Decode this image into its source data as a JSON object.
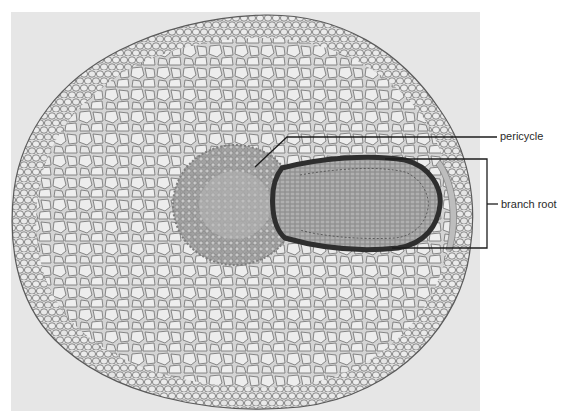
{
  "figure": {
    "labels": [
      {
        "id": "pericycle",
        "text": "pericycle"
      },
      {
        "id": "branch_root",
        "text": "branch root"
      }
    ]
  },
  "colors": {
    "background": "#ffffff",
    "photo_background": "#e6e6e6",
    "cell_wall": "#6e6e6e",
    "cell_fill": "#e2e2e2",
    "stele": "#a8a8a8",
    "branch_root_dark": "#3a3a3a",
    "leader_line": "#1e1e1e",
    "label_text": "#2a2a2a"
  }
}
